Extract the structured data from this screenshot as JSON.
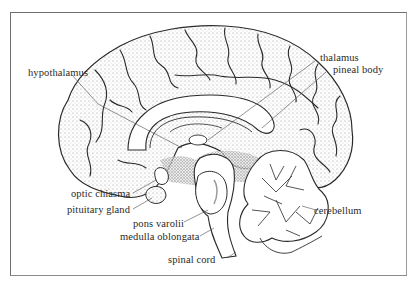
{
  "figure": {
    "labels": {
      "hypothalamus": "hypothalamus",
      "thalamus": "thalamus",
      "pineal_body": "pineal body",
      "optic_chiasma": "optic chiasma",
      "pituitary_gland": "pituitary gland",
      "pons_varolii": "pons varolii",
      "medulla_oblongata": "medulla oblongata",
      "spinal_cord": "spinal cord",
      "cerebellum": "cerebellum"
    },
    "colors": {
      "ink": "#2a2a2a",
      "stipple": "#8c8c8c",
      "frame": "#6f6f6f",
      "background": "#ffffff"
    }
  }
}
